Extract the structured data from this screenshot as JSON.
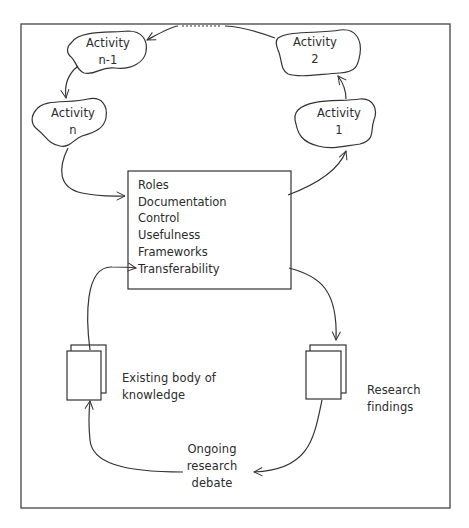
{
  "diagram": {
    "type": "cycle-flow",
    "activities": [
      {
        "id": "activity-n-1",
        "line1": "Activity",
        "line2": "n-1"
      },
      {
        "id": "activity-2",
        "line1": "Activity",
        "line2": "2"
      },
      {
        "id": "activity-n",
        "line1": "Activity",
        "line2": "n"
      },
      {
        "id": "activity-1",
        "line1": "Activity",
        "line2": "1"
      }
    ],
    "central_box": {
      "items": [
        "Roles",
        "Documentation",
        "Control",
        "Usefulness",
        "Frameworks",
        "Transferability"
      ]
    },
    "documents": {
      "existing": {
        "line1": "Existing body of",
        "line2": "knowledge"
      },
      "findings": {
        "line1": "Research",
        "line2": "findings"
      }
    },
    "debate": {
      "line1": "Ongoing",
      "line2": "research",
      "line3": "debate"
    },
    "edges": [
      {
        "from": "activity-2",
        "to": "activity-n-1",
        "style": "dotted-middle"
      },
      {
        "from": "activity-n-1",
        "to": "activity-n"
      },
      {
        "from": "activity-n",
        "to": "central-box"
      },
      {
        "from": "central-box",
        "to": "activity-1"
      },
      {
        "from": "activity-1",
        "to": "activity-2"
      },
      {
        "from": "central-box",
        "to": "research-findings"
      },
      {
        "from": "research-findings",
        "to": "ongoing-research-debate"
      },
      {
        "from": "ongoing-research-debate",
        "to": "existing-body-of-knowledge"
      },
      {
        "from": "existing-body-of-knowledge",
        "to": "central-box"
      }
    ],
    "colors": {
      "stroke": "#333333",
      "background": "#ffffff"
    }
  }
}
